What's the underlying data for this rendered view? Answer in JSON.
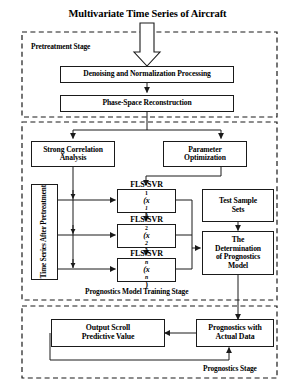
{
  "diagram": {
    "title": "Multivariate Time Series of Aircraft",
    "type": "flowchart",
    "stages": [
      {
        "id": "pretreatment",
        "label": "Pretreatment Stage",
        "border": "dashed"
      },
      {
        "id": "training",
        "label": "Prognostics Model Training Stage",
        "border": "dashed"
      },
      {
        "id": "prognostics",
        "label": "Prognostics Stage",
        "border": "dashed"
      }
    ],
    "nodes": [
      {
        "id": "denoise",
        "label": "Denoising and Normalization Processing",
        "stage": "pretreatment"
      },
      {
        "id": "phase",
        "label": "Phase-Space Reconstruction",
        "stage": "pretreatment"
      },
      {
        "id": "strongcorr_l1",
        "label": "Strong Correlation",
        "stage": "training"
      },
      {
        "id": "strongcorr_l2",
        "label": "Analysis",
        "stage": "training"
      },
      {
        "id": "param_l1",
        "label": "Parameter",
        "stage": "training"
      },
      {
        "id": "param_l2",
        "label": "Optimization",
        "stage": "training"
      },
      {
        "id": "timeseries",
        "label": "Time Series After Pretreatment",
        "stage": "training",
        "orientation": "vertical"
      },
      {
        "id": "fls1",
        "label": "FLS-SVR",
        "sub": "1",
        "arg": "(x",
        "argsub": "1",
        "argend": ")",
        "stage": "training"
      },
      {
        "id": "fls2",
        "label": "FLS-SVR",
        "sub": "2",
        "arg": "(x",
        "argsub": "2",
        "argend": ")",
        "stage": "training"
      },
      {
        "id": "flsn",
        "label": "FLS-SVR",
        "sub": "n",
        "arg": "(x",
        "argsub": "n",
        "argend": ")",
        "stage": "training"
      },
      {
        "id": "testsample_l1",
        "label": "Test Sample",
        "stage": "training"
      },
      {
        "id": "testsample_l2",
        "label": "Sets",
        "stage": "training"
      },
      {
        "id": "determ_l1",
        "label": "The",
        "stage": "training"
      },
      {
        "id": "determ_l2",
        "label": "Determination",
        "stage": "training"
      },
      {
        "id": "determ_l3",
        "label": "of Prognostics",
        "stage": "training"
      },
      {
        "id": "determ_l4",
        "label": "Model",
        "stage": "training"
      },
      {
        "id": "output_l1",
        "label": "Output Scroll",
        "stage": "prognostics"
      },
      {
        "id": "output_l2",
        "label": "Predictive Value",
        "stage": "prognostics"
      },
      {
        "id": "prog_l1",
        "label": "Prognostics with",
        "stage": "prognostics"
      },
      {
        "id": "prog_l2",
        "label": "Actual Data",
        "stage": "prognostics"
      }
    ],
    "colors": {
      "stroke": "#1a1a1a",
      "background": "#ffffff",
      "text": "#000000"
    }
  }
}
